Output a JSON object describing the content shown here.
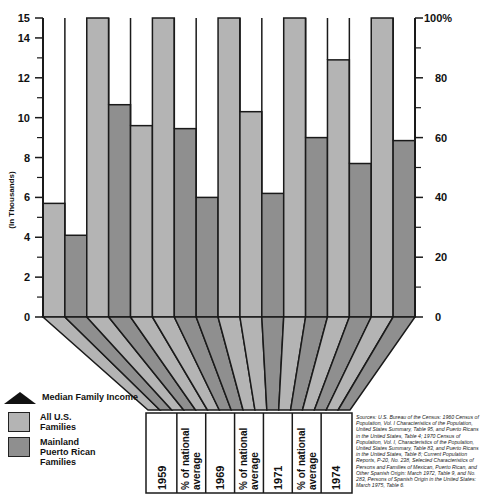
{
  "chart_data": {
    "type": "bar",
    "title": "",
    "left_axis": {
      "label": "(In Thousands)",
      "ticks": [
        "0",
        "2",
        "4",
        "6",
        "8",
        "10",
        "12",
        "14",
        "15"
      ],
      "range": [
        0,
        15
      ]
    },
    "right_axis": {
      "label": "",
      "ticks": [
        "0",
        "20",
        "40",
        "60",
        "80",
        "100%"
      ],
      "range": [
        0,
        100
      ]
    },
    "categories": [
      "1959",
      "% of national average",
      "1969",
      "% of national average",
      "1971",
      "% of national average",
      "1974"
    ],
    "series": [
      {
        "name": "All U.S. Families",
        "values": [
          5.7,
          100,
          9.6,
          100,
          10.3,
          100,
          12.9
        ],
        "units": [
          "thousands",
          "percent",
          "thousands",
          "percent",
          "thousands",
          "percent",
          "thousands"
        ]
      },
      {
        "name": "Mainland Puerto Rican Families",
        "values": [
          4.1,
          71,
          6.0,
          63,
          6.2,
          60,
          7.7
        ],
        "units": [
          "thousands",
          "percent",
          "thousands",
          "percent",
          "thousands",
          "percent",
          "thousands"
        ]
      }
    ],
    "bars_left_to_right": [
      {
        "group": "1959",
        "series": "All U.S. Families",
        "value": 5.7,
        "axis": "left"
      },
      {
        "group": "1959",
        "series": "Mainland Puerto Rican Families",
        "value": 4.1,
        "axis": "left"
      },
      {
        "group": "% of national average",
        "series": "All U.S. Families",
        "value": 100,
        "axis": "right"
      },
      {
        "group": "% of national average",
        "series": "Mainland Puerto Rican Families",
        "value": 71,
        "axis": "right"
      },
      {
        "group": "1969",
        "series": "All U.S. Families",
        "value": 9.6,
        "axis": "left"
      },
      {
        "group": "% of national average",
        "series": "All U.S. Families",
        "value": 100,
        "axis": "right"
      },
      {
        "group": "% of national average",
        "series": "Mainland Puerto Rican Families",
        "value": 63,
        "axis": "right"
      },
      {
        "group": "1969",
        "series": "Mainland Puerto Rican Families",
        "value": 6.0,
        "axis": "left"
      },
      {
        "group": "% of national average",
        "series": "All U.S. Families",
        "value": 100,
        "axis": "right"
      },
      {
        "group": "1971",
        "series": "All U.S. Families",
        "value": 10.3,
        "axis": "left"
      },
      {
        "group": "1971",
        "series": "Mainland Puerto Rican Families",
        "value": 6.2,
        "axis": "left"
      },
      {
        "group": "% of national average",
        "series": "All U.S. Families",
        "value": 100,
        "axis": "right"
      },
      {
        "group": "% of national average",
        "series": "Mainland Puerto Rican Families",
        "value": 60,
        "axis": "right"
      },
      {
        "group": "1974",
        "series": "All U.S. Families",
        "value": 12.9,
        "axis": "left"
      },
      {
        "group": "1974",
        "series": "Mainland Puerto Rican Families",
        "value": 7.7,
        "axis": "left"
      },
      {
        "group": "% of national average",
        "series": "All U.S. Families",
        "value": 100,
        "axis": "right"
      },
      {
        "group": "% of national average",
        "series": "Mainland Puerto Rican Families",
        "value": 59,
        "axis": "right"
      }
    ],
    "grid": false,
    "legend_position": "bottom-left"
  },
  "axes": {
    "left_title": "(In Thousands)",
    "left_ticks": [
      {
        "label": "0",
        "value": 0
      },
      {
        "label": "2",
        "value": 2
      },
      {
        "label": "4",
        "value": 4
      },
      {
        "label": "6",
        "value": 6
      },
      {
        "label": "8",
        "value": 8
      },
      {
        "label": "10",
        "value": 10
      },
      {
        "label": "12",
        "value": 12
      },
      {
        "label": "14",
        "value": 14
      },
      {
        "label": "15",
        "value": 15
      }
    ],
    "right_ticks": [
      {
        "label": "0",
        "value": 0
      },
      {
        "label": "20",
        "value": 20
      },
      {
        "label": "40",
        "value": 40
      },
      {
        "label": "60",
        "value": 60
      },
      {
        "label": "80",
        "value": 80
      },
      {
        "label": "100%",
        "value": 100
      }
    ]
  },
  "bottom_labels": [
    {
      "text": "1959"
    },
    {
      "text": "% of national average"
    },
    {
      "text": "1969"
    },
    {
      "text": "% of national average"
    },
    {
      "text": "1971"
    },
    {
      "text": "% of national average"
    },
    {
      "text": "1974"
    }
  ],
  "legend": {
    "title": "Median Family Income",
    "items": [
      {
        "label_line1": "All U.S.",
        "label_line2": "Families",
        "label_line3": ""
      },
      {
        "label_line1": "Mainland",
        "label_line2": "Puerto Rican",
        "label_line3": "Families"
      }
    ]
  },
  "colors": {
    "all_us": "#b4b4b4",
    "puerto_rican": "#8f8f8f",
    "outline": "#1a1a1a",
    "empty": "#ffffff"
  },
  "sources": "Sources: U.S. Bureau of the Census: 1960 Census of Population, Vol. I Characteristics of the Population, United States Summary, Table 95, and Puerto Ricans in the United States, Table 4; 1970 Census of Population, Vol. I, Characteristics of the Population, United States Summary, Table 83, and Puerto Ricans in the United States, Table 8; Current Population Reports, P-20, No. 238, Selected Characteristics of Persons and Families of Mexican, Puerto Rican, and Other Spanish Origin: March 1972, Table 9, and No. 283, Persons of Spanish Origin in the United States: March 1975, Table 6."
}
